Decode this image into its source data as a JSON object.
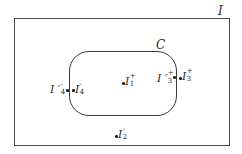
{
  "diagram": {
    "outer_region": {
      "label": "I"
    },
    "inner_region": {
      "label": "C"
    },
    "points": [
      {
        "id": "I1plus",
        "base": "I",
        "prime": "",
        "superscript": "+",
        "subscript": "1",
        "location": "inside C"
      },
      {
        "id": "I2minus",
        "base": "I",
        "prime": "",
        "superscript": "-",
        "subscript": "2",
        "location": "outside C, inside I"
      },
      {
        "id": "I3plus",
        "base": "I",
        "prime": "",
        "superscript": "+",
        "subscript": "3",
        "location": "outside C, right edge"
      },
      {
        "id": "I3primeplus",
        "base": "I",
        "prime": "′",
        "superscript": "+",
        "subscript": "3",
        "location": "inside C, right edge"
      },
      {
        "id": "I4minus",
        "base": "I",
        "prime": "",
        "superscript": "-",
        "subscript": "4",
        "location": "inside C, left edge"
      },
      {
        "id": "I4primeminus",
        "base": "I",
        "prime": "′",
        "superscript": "-",
        "subscript": "4",
        "location": "outside C, left edge"
      }
    ],
    "labels": {
      "outer": "I",
      "inner": "C",
      "p1_base": "I",
      "p1_sup": "+",
      "p1_sub": "1",
      "p2_base": "I",
      "p2_sup": "-",
      "p2_sub": "2",
      "p3_base": "I",
      "p3_sup": "+",
      "p3_sub": "3",
      "p3p_base": "I ′",
      "p3p_sup": "+",
      "p3p_sub": "3",
      "p4_base": "I",
      "p4_sup": "-",
      "p4_sub": "4",
      "p4p_base": "I ′",
      "p4p_sup": "-",
      "p4p_sub": "4"
    }
  }
}
